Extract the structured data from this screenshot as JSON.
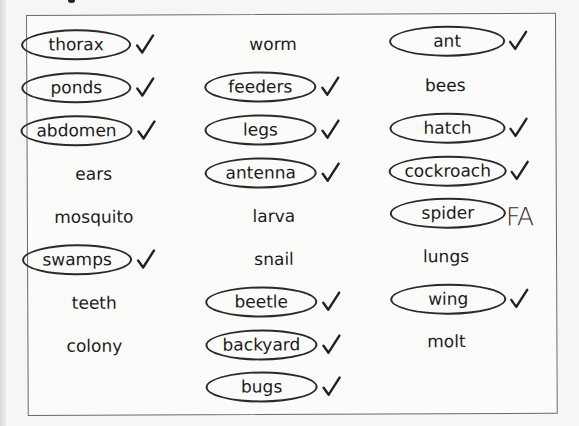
{
  "worksheet": {
    "columns": [
      {
        "items": [
          {
            "word": "thorax",
            "circled": true,
            "mark": "check"
          },
          {
            "word": "ponds",
            "circled": true,
            "mark": "check"
          },
          {
            "word": "abdomen",
            "circled": true,
            "mark": "check"
          },
          {
            "word": "ears",
            "circled": false,
            "mark": ""
          },
          {
            "word": "mosquito",
            "circled": false,
            "mark": ""
          },
          {
            "word": "swamps",
            "circled": true,
            "mark": "check"
          },
          {
            "word": "teeth",
            "circled": false,
            "mark": ""
          },
          {
            "word": "colony",
            "circled": false,
            "mark": ""
          }
        ]
      },
      {
        "items": [
          {
            "word": "worm",
            "circled": false,
            "mark": ""
          },
          {
            "word": "feeders",
            "circled": true,
            "mark": "check"
          },
          {
            "word": "legs",
            "circled": true,
            "mark": "check"
          },
          {
            "word": "antenna",
            "circled": true,
            "mark": "check"
          },
          {
            "word": "larva",
            "circled": false,
            "mark": ""
          },
          {
            "word": "snail",
            "circled": false,
            "mark": ""
          },
          {
            "word": "beetle",
            "circled": true,
            "mark": "check"
          },
          {
            "word": "backyard",
            "circled": true,
            "mark": "check"
          },
          {
            "word": "bugs",
            "circled": true,
            "mark": "check"
          }
        ]
      },
      {
        "items": [
          {
            "word": "ant",
            "circled": true,
            "mark": "check"
          },
          {
            "word": "bees",
            "circled": false,
            "mark": ""
          },
          {
            "word": "hatch",
            "circled": true,
            "mark": "check"
          },
          {
            "word": "cockroach",
            "circled": true,
            "mark": "check"
          },
          {
            "word": "spider",
            "circled": true,
            "mark": "FA"
          },
          {
            "word": "lungs",
            "circled": false,
            "mark": ""
          },
          {
            "word": "wing",
            "circled": true,
            "mark": "check"
          },
          {
            "word": "molt",
            "circled": false,
            "mark": ""
          }
        ]
      }
    ],
    "annotations": {
      "spider_mark": "FA",
      "check_icon": "check-mark-icon"
    }
  }
}
